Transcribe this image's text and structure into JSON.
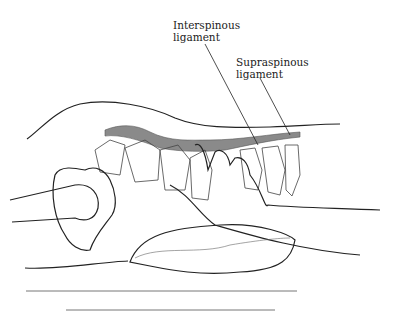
{
  "figure": {
    "labels": [
      {
        "id": "interspinous",
        "line1": "Interspinous",
        "line2": "ligament"
      },
      {
        "id": "supraspinous",
        "line1": "Supraspinous",
        "line2": "ligament"
      }
    ],
    "colors": {
      "outline": "#222222",
      "ligament_fill": "#8a8a8a",
      "bone_line": "#555555",
      "rule_line": "#777777"
    }
  }
}
